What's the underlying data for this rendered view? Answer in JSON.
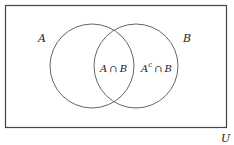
{
  "diagram": {
    "type": "venn",
    "universe_label": "U",
    "sets": [
      {
        "label": "A",
        "cx": 92,
        "cy": 66,
        "r": 42
      },
      {
        "label": "B",
        "cx": 136,
        "cy": 66,
        "r": 42
      }
    ],
    "regions": [
      {
        "label_left": "A",
        "op": "∩",
        "label_right": "B",
        "sup": ""
      },
      {
        "label_left": "A",
        "op": "∩",
        "label_right": "B",
        "sup": "c"
      }
    ],
    "colors": {
      "stroke": "#555555",
      "frame": "#444444",
      "text": "#222222"
    }
  }
}
